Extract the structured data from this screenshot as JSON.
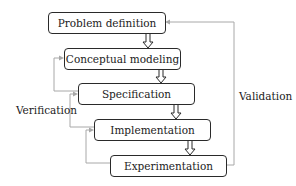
{
  "diagram": {
    "type": "flowchart",
    "nodes": [
      {
        "id": "problem",
        "label": "Problem definition"
      },
      {
        "id": "conceptual",
        "label": "Conceptual modeling"
      },
      {
        "id": "specification",
        "label": "Specification"
      },
      {
        "id": "implementation",
        "label": "Implementation"
      },
      {
        "id": "experimentation",
        "label": "Experimentation"
      }
    ],
    "edges": [
      {
        "from": "problem",
        "to": "conceptual",
        "style": "hollow-arrow"
      },
      {
        "from": "conceptual",
        "to": "specification",
        "style": "hollow-arrow"
      },
      {
        "from": "specification",
        "to": "implementation",
        "style": "hollow-arrow"
      },
      {
        "from": "implementation",
        "to": "experimentation",
        "style": "hollow-arrow"
      },
      {
        "from": "specification",
        "to": "conceptual",
        "style": "feedback",
        "group": "verification"
      },
      {
        "from": "implementation",
        "to": "specification",
        "style": "feedback",
        "group": "verification"
      },
      {
        "from": "experimentation",
        "to": "implementation",
        "style": "feedback",
        "group": "verification"
      },
      {
        "from": "experimentation",
        "to": "problem",
        "style": "feedback",
        "group": "validation"
      }
    ],
    "annotations": {
      "verification": "Verification",
      "validation": "Validation"
    },
    "colors": {
      "box_border": "#2a2a2a",
      "feedback_line": "#a8a8a8",
      "text": "#222222"
    }
  }
}
